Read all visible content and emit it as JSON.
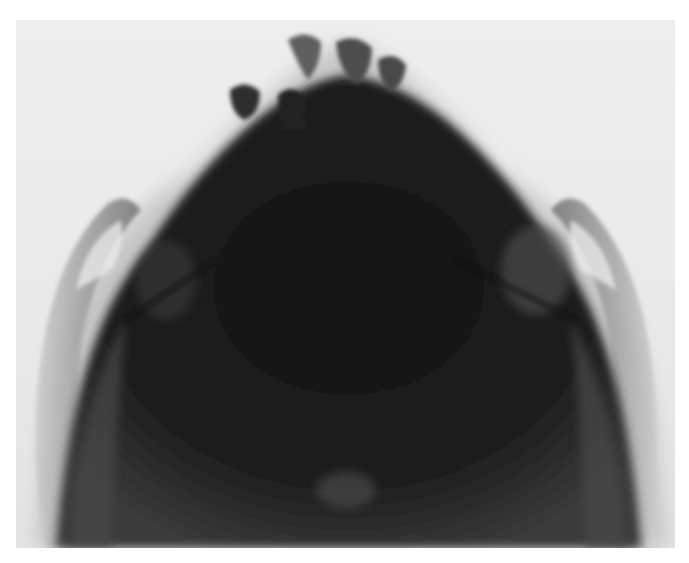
{
  "image": {
    "subject": "radiograph",
    "view": "occlusal / submentovertex skull x-ray",
    "colors": {
      "background": "#ffffff",
      "film": "#ececec",
      "soft_tissue": "#9a9a9a",
      "bone_dense": "#1c1c1c",
      "bone_mid": "#3a3a3a",
      "tooth": "#555555"
    }
  }
}
